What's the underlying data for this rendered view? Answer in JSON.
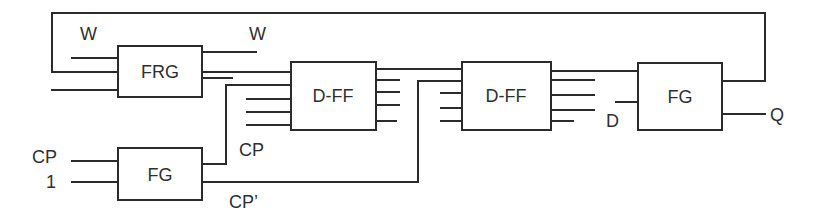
{
  "diagram": {
    "blocks": {
      "frg": "FRG",
      "dff1": "D-FF",
      "dff2": "D-FF",
      "fg_clock": "FG",
      "fg_out": "FG"
    },
    "signals": {
      "w_in": "W",
      "w_out": "W",
      "cp_in": "CP",
      "one_in": "1",
      "cp_mid": "CP",
      "cp_prime": "CP’",
      "d_in": "D",
      "q_out": "Q"
    }
  }
}
